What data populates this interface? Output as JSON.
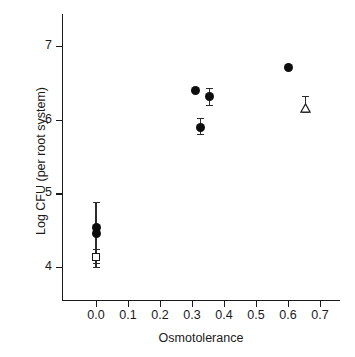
{
  "chart_data": {
    "type": "scatter",
    "title": "",
    "xlabel": "Osmotolerance",
    "ylabel": "Log CFU (per root system)",
    "xlim": [
      -0.04,
      0.755
    ],
    "ylim": [
      3.58,
      7.47
    ],
    "grid": false,
    "legend": "none",
    "xticks": [
      "0.0",
      "0.1",
      "0.2",
      "0.3",
      "0.4",
      "0.5",
      "0.6",
      "0.7"
    ],
    "xtick_values": [
      0.0,
      0.1,
      0.2,
      0.3,
      0.4,
      0.5,
      0.6,
      0.7
    ],
    "yticks": [
      "4",
      "5",
      "6",
      "7"
    ],
    "ytick_values": [
      4,
      5,
      6,
      7
    ],
    "marker_colors": {
      "filled": "#0d0d0d",
      "open_fill": "#ffffff",
      "open_stroke": "#1a1a1a",
      "errorbar": "#2b2b2b",
      "axis": "#1a1a1a"
    },
    "series": [
      {
        "name": "filled-circle",
        "marker": "circle-filled",
        "points": [
          {
            "x": 0.0,
            "y": 4.53,
            "yerr_low": 4.05,
            "yerr_high": 4.88
          },
          {
            "x": 0.0,
            "y": 4.45,
            "yerr_low": null,
            "yerr_high": null
          },
          {
            "x": 0.31,
            "y": 6.4,
            "yerr_low": null,
            "yerr_high": null
          },
          {
            "x": 0.327,
            "y": 5.9,
            "yerr_low": 5.8,
            "yerr_high": 6.02
          },
          {
            "x": 0.355,
            "y": 6.31,
            "yerr_low": 6.2,
            "yerr_high": 6.43
          },
          {
            "x": 0.6,
            "y": 6.71,
            "yerr_low": null,
            "yerr_high": null
          }
        ]
      },
      {
        "name": "open-square",
        "marker": "square-open",
        "points": [
          {
            "x": 0.0,
            "y": 4.14,
            "yerr_low": 4.0,
            "yerr_high": 4.25
          }
        ]
      },
      {
        "name": "open-triangle",
        "marker": "triangle-open",
        "points": [
          {
            "x": 0.655,
            "y": 6.21,
            "yerr_low": 6.1,
            "yerr_high": 6.32
          }
        ]
      }
    ]
  }
}
